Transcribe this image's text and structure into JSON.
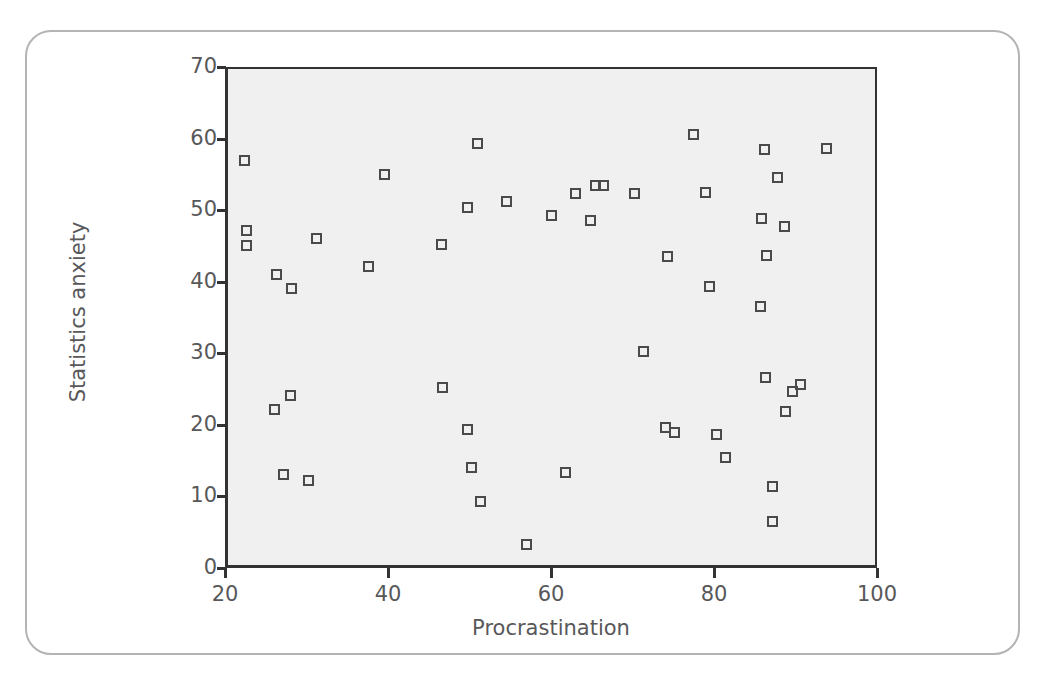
{
  "figure": {
    "border_color": "#b4b4b4",
    "background_color": "#ffffff"
  },
  "chart_data": {
    "type": "scatter",
    "title": "",
    "xlabel": "Procrastination",
    "ylabel": "Statistics anxiety",
    "xlim": [
      20,
      100
    ],
    "ylim": [
      0,
      70
    ],
    "xticks": [
      20,
      40,
      60,
      80,
      100
    ],
    "yticks": [
      0,
      10,
      20,
      30,
      40,
      50,
      60,
      70
    ],
    "grid": false,
    "legend": null,
    "plot_background_color": "#f0f0f0",
    "axis_color": "#333333",
    "tick_label_color": "#58585a",
    "marker": {
      "shape": "open-square",
      "edge_color": "#4a4a4a",
      "fill": "none",
      "size_px": 11
    },
    "n_points": 57,
    "points": [
      [
        22.4,
        57.0
      ],
      [
        22.6,
        47.2
      ],
      [
        22.6,
        45.0
      ],
      [
        26.3,
        41.0
      ],
      [
        26.1,
        22.1
      ],
      [
        27.2,
        13.1
      ],
      [
        28.1,
        39.0
      ],
      [
        28.0,
        24.1
      ],
      [
        30.2,
        12.2
      ],
      [
        31.2,
        46.0
      ],
      [
        37.6,
        42.1
      ],
      [
        39.6,
        55.0
      ],
      [
        46.6,
        45.2
      ],
      [
        46.7,
        25.2
      ],
      [
        49.7,
        50.3
      ],
      [
        49.7,
        19.3
      ],
      [
        50.3,
        14.1
      ],
      [
        51.0,
        59.3
      ],
      [
        51.3,
        9.3
      ],
      [
        54.5,
        51.2
      ],
      [
        57.0,
        3.3
      ],
      [
        60.0,
        49.3
      ],
      [
        61.8,
        13.3
      ],
      [
        63.0,
        52.3
      ],
      [
        64.8,
        48.5
      ],
      [
        65.5,
        53.4
      ],
      [
        66.4,
        53.5
      ],
      [
        70.2,
        52.3
      ],
      [
        71.4,
        30.3
      ],
      [
        74.0,
        19.6
      ],
      [
        74.3,
        43.5
      ],
      [
        75.2,
        18.9
      ],
      [
        77.5,
        60.5
      ],
      [
        79.0,
        52.4
      ],
      [
        79.5,
        39.4
      ],
      [
        80.3,
        18.6
      ],
      [
        81.4,
        15.5
      ],
      [
        85.7,
        36.5
      ],
      [
        85.8,
        48.8
      ],
      [
        86.2,
        58.5
      ],
      [
        86.4,
        43.7
      ],
      [
        86.3,
        26.6
      ],
      [
        87.2,
        11.4
      ],
      [
        87.2,
        6.5
      ],
      [
        87.8,
        54.6
      ],
      [
        88.6,
        47.7
      ],
      [
        88.8,
        21.8
      ],
      [
        89.6,
        24.6
      ],
      [
        90.6,
        25.6
      ],
      [
        93.8,
        58.6
      ]
    ]
  }
}
